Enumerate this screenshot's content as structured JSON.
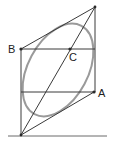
{
  "diagram": {
    "labels": {
      "A": "A",
      "B": "B",
      "C": "C"
    },
    "points": {
      "top": {
        "x": 95,
        "y": 7
      },
      "B": {
        "x": 21,
        "y": 49
      },
      "C": {
        "x": 70,
        "y": 49
      },
      "A": {
        "x": 94,
        "y": 92
      },
      "bottom": {
        "x": 21,
        "y": 135
      }
    },
    "colors": {
      "line": "#3a3a3a",
      "ellipse": "#9a9a9a",
      "text": "#222222"
    }
  }
}
